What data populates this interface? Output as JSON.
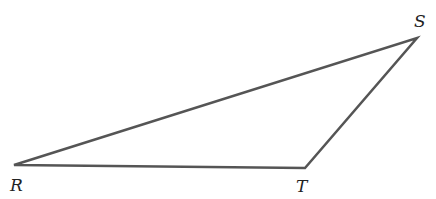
{
  "diagram": {
    "type": "triangle",
    "stroke_color": "#555555",
    "stroke_width": 2.5,
    "vertices": [
      {
        "name": "R",
        "label": "R",
        "x": 14,
        "y": 165,
        "label_x": 10,
        "label_y": 191
      },
      {
        "name": "T",
        "label": "T",
        "x": 305,
        "y": 168,
        "label_x": 296,
        "label_y": 192
      },
      {
        "name": "S",
        "label": "S",
        "x": 417,
        "y": 38,
        "label_x": 414,
        "label_y": 27
      }
    ],
    "edges": [
      {
        "from": "R",
        "to": "S"
      },
      {
        "from": "S",
        "to": "T"
      },
      {
        "from": "T",
        "to": "R"
      }
    ]
  }
}
